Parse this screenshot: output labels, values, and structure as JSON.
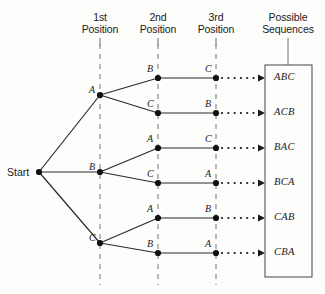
{
  "figure": {
    "type": "tree-diagram",
    "background": "#fdfdfc",
    "line_color": "#2b2b2b",
    "dashed_color": "#8a8a8a"
  },
  "headers": [
    {
      "name": "position-1",
      "label": "1st\nPosition",
      "x": 100
    },
    {
      "name": "position-2",
      "label": "2nd\nPosition",
      "x": 158
    },
    {
      "name": "position-3",
      "label": "3rd\nPosition",
      "x": 216
    },
    {
      "name": "possible-sequences",
      "label": "Possible\nSequences",
      "x": 288
    }
  ],
  "start": {
    "label": "Start",
    "x": 39,
    "y": 172
  },
  "level1": [
    {
      "label": "A",
      "x": 100,
      "y": 95
    },
    {
      "label": "B",
      "x": 100,
      "y": 172
    },
    {
      "label": "C",
      "x": 100,
      "y": 243
    }
  ],
  "level2": [
    {
      "label": "B",
      "x": 158,
      "y": 78,
      "parent": "A"
    },
    {
      "label": "C",
      "x": 158,
      "y": 113,
      "parent": "A"
    },
    {
      "label": "A",
      "x": 158,
      "y": 148,
      "parent": "B"
    },
    {
      "label": "C",
      "x": 158,
      "y": 183,
      "parent": "B"
    },
    {
      "label": "A",
      "x": 158,
      "y": 218,
      "parent": "C"
    },
    {
      "label": "B",
      "x": 158,
      "y": 253,
      "parent": "C"
    }
  ],
  "level3": [
    {
      "label": "C",
      "x": 216,
      "y": 78
    },
    {
      "label": "B",
      "x": 216,
      "y": 113
    },
    {
      "label": "C",
      "x": 216,
      "y": 148
    },
    {
      "label": "A",
      "x": 216,
      "y": 183
    },
    {
      "label": "B",
      "x": 216,
      "y": 218
    },
    {
      "label": "A",
      "x": 216,
      "y": 253
    }
  ],
  "sequences": [
    {
      "label": "ABC",
      "y": 78
    },
    {
      "label": "ACB",
      "y": 113
    },
    {
      "label": "BAC",
      "y": 148
    },
    {
      "label": "BCA",
      "y": 183
    },
    {
      "label": "CAB",
      "y": 218
    },
    {
      "label": "CBA",
      "y": 253
    }
  ],
  "sequence_box": {
    "x": 265,
    "y": 65,
    "width": 47,
    "height": 212
  }
}
